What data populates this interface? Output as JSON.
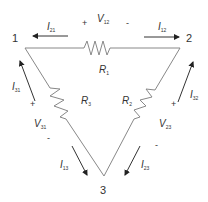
{
  "diagram": {
    "type": "delta resistor network",
    "nodes": [
      {
        "id": "1",
        "label": "1"
      },
      {
        "id": "2",
        "label": "2"
      },
      {
        "id": "3",
        "label": "3"
      }
    ],
    "resistors": [
      {
        "label": "R",
        "sub": "1",
        "between": "1-2"
      },
      {
        "label": "R",
        "sub": "2",
        "between": "2-3"
      },
      {
        "label": "R",
        "sub": "3",
        "between": "1-3"
      }
    ],
    "voltages": [
      {
        "label": "V",
        "sub": "12",
        "plus": "+",
        "minus": "-"
      },
      {
        "label": "V",
        "sub": "23",
        "plus": "+",
        "minus": "-"
      },
      {
        "label": "V",
        "sub": "31",
        "plus": "+",
        "minus": "-"
      }
    ],
    "currents": [
      {
        "label": "I",
        "sub": "21"
      },
      {
        "label": "I",
        "sub": "12"
      },
      {
        "label": "I",
        "sub": "31"
      },
      {
        "label": "I",
        "sub": "32"
      },
      {
        "label": "I",
        "sub": "13"
      },
      {
        "label": "I",
        "sub": "23"
      }
    ]
  }
}
